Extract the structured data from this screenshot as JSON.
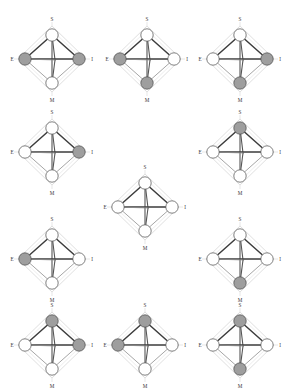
{
  "figure": {
    "vertex_labels": {
      "top": "S",
      "left": "E",
      "right": "I",
      "bottom": "M"
    },
    "node_states": {
      "filled": "gray",
      "empty": "white"
    },
    "colors": {
      "node_fill_gray": "#9e9e9e",
      "node_fill_white": "#ffffff",
      "node_stroke": "#4a4a4a",
      "edge_strong": "#3c3c3c",
      "edge_mid": "#555555",
      "edge_light": "#8e8e8e",
      "frame": "#c9c9c9",
      "label": "#3a3a3a",
      "background": "#ffffff"
    },
    "grid": {
      "rows": 4,
      "columns": 3,
      "panel_count": 11
    }
  },
  "panels": [
    {
      "id": "panel-1",
      "row": 1,
      "col": 1,
      "x": 5,
      "y": 12,
      "labels": {
        "top": "S",
        "left": "E",
        "right": "I",
        "bottom": "M"
      },
      "nodes": {
        "S": "white",
        "E": "gray",
        "I": "gray",
        "M": "white"
      }
    },
    {
      "id": "panel-2",
      "row": 1,
      "col": 2,
      "x": 100,
      "y": 12,
      "labels": {
        "top": "S",
        "left": "E",
        "right": "I",
        "bottom": "M"
      },
      "nodes": {
        "S": "white",
        "E": "gray",
        "I": "white",
        "M": "gray"
      }
    },
    {
      "id": "panel-3",
      "row": 1,
      "col": 3,
      "x": 193,
      "y": 12,
      "labels": {
        "top": "S",
        "left": "E",
        "right": "I",
        "bottom": "M"
      },
      "nodes": {
        "S": "white",
        "E": "white",
        "I": "gray",
        "M": "gray"
      }
    },
    {
      "id": "panel-4",
      "row": 2,
      "col": 1,
      "x": 5,
      "y": 105,
      "labels": {
        "top": "S",
        "left": "E",
        "right": "I",
        "bottom": "M"
      },
      "nodes": {
        "S": "white",
        "E": "white",
        "I": "gray",
        "M": "white"
      }
    },
    {
      "id": "panel-5",
      "row": 2,
      "col": 3,
      "x": 193,
      "y": 105,
      "labels": {
        "top": "S",
        "left": "E",
        "right": "I",
        "bottom": "M"
      },
      "nodes": {
        "S": "gray",
        "E": "white",
        "I": "white",
        "M": "white"
      }
    },
    {
      "id": "panel-6",
      "row": 0,
      "col": 2,
      "x": 98,
      "y": 160,
      "labels": {
        "top": "S",
        "left": "E",
        "right": "I",
        "bottom": "M"
      },
      "nodes": {
        "S": "white",
        "E": "white",
        "I": "white",
        "M": "white"
      }
    },
    {
      "id": "panel-7",
      "row": 3,
      "col": 1,
      "x": 5,
      "y": 212,
      "labels": {
        "top": "S",
        "left": "E",
        "right": "I",
        "bottom": "M"
      },
      "nodes": {
        "S": "white",
        "E": "gray",
        "I": "white",
        "M": "white"
      }
    },
    {
      "id": "panel-8",
      "row": 3,
      "col": 3,
      "x": 193,
      "y": 212,
      "labels": {
        "top": "S",
        "left": "E",
        "right": "I",
        "bottom": "M"
      },
      "nodes": {
        "S": "white",
        "E": "white",
        "I": "white",
        "M": "gray"
      }
    },
    {
      "id": "panel-9",
      "row": 4,
      "col": 1,
      "x": 5,
      "y": 298,
      "labels": {
        "top": "S",
        "left": "E",
        "right": "I",
        "bottom": "M"
      },
      "nodes": {
        "S": "gray",
        "E": "white",
        "I": "gray",
        "M": "white"
      }
    },
    {
      "id": "panel-10",
      "row": 4,
      "col": 2,
      "x": 98,
      "y": 298,
      "labels": {
        "top": "S",
        "left": "E",
        "right": "I",
        "bottom": "M"
      },
      "nodes": {
        "S": "gray",
        "E": "gray",
        "I": "white",
        "M": "white"
      }
    },
    {
      "id": "panel-11",
      "row": 4,
      "col": 3,
      "x": 193,
      "y": 298,
      "labels": {
        "top": "S",
        "left": "E",
        "right": "I",
        "bottom": "M"
      },
      "nodes": {
        "S": "gray",
        "E": "white",
        "I": "white",
        "M": "gray"
      }
    }
  ]
}
